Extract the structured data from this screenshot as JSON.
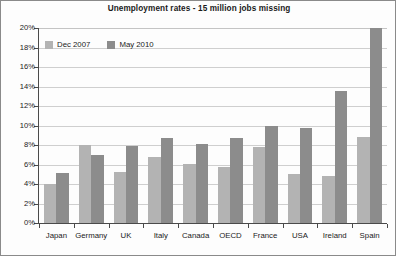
{
  "chart_data": {
    "type": "bar",
    "title": "Unemployment rates - 15 million jobs missing",
    "xlabel": "",
    "ylabel": "",
    "ylim": [
      0,
      20
    ],
    "ytick_values": [
      0,
      2,
      4,
      6,
      8,
      10,
      12,
      14,
      16,
      18,
      20
    ],
    "ytick_labels": [
      "0%",
      "2%",
      "4%",
      "6%",
      "8%",
      "10%",
      "12%",
      "14%",
      "16%",
      "18%",
      "20%"
    ],
    "grid": true,
    "legend_position": "top-left-inside",
    "categories": [
      "Japan",
      "Germany",
      "UK",
      "Italy",
      "Canada",
      "OECD",
      "France",
      "USA",
      "Ireland",
      "Spain"
    ],
    "series": [
      {
        "name": "Dec 2007",
        "color": "#b3b3b3",
        "values": [
          4.0,
          8.0,
          5.2,
          6.8,
          6.1,
          5.7,
          7.8,
          5.0,
          4.8,
          8.8
        ]
      },
      {
        "name": "May 2010",
        "color": "#8c8c8c",
        "values": [
          5.1,
          7.0,
          7.9,
          8.7,
          8.1,
          8.7,
          10.0,
          9.7,
          13.5,
          20.0
        ]
      }
    ]
  },
  "legend": {
    "entries": [
      {
        "label": "Dec 2007"
      },
      {
        "label": "May 2010"
      }
    ]
  }
}
